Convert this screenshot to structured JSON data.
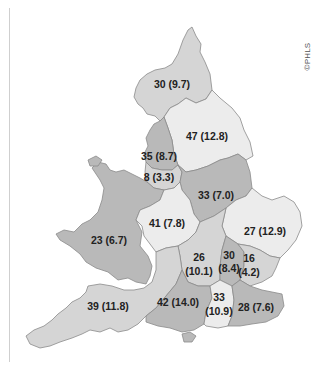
{
  "credit": "©PHLS",
  "colors": {
    "light": "#ececec",
    "medium": "#d5d5d5",
    "dark": "#b9b9b9",
    "border": "#8a8a8a",
    "text": "#222222"
  },
  "regions": [
    {
      "id": "northern",
      "count": 30,
      "rate": "9.7",
      "label": "30 (9.7)",
      "shade": "medium"
    },
    {
      "id": "yorkshire",
      "count": 47,
      "rate": "12.8",
      "label": "47 (12.8)",
      "shade": "light"
    },
    {
      "id": "north-west",
      "count": 35,
      "rate": "8.7",
      "label": "35 (8.7)",
      "shade": "dark"
    },
    {
      "id": "mersey",
      "count": 8,
      "rate": "3.3",
      "label": "8 (3.3)",
      "shade": "medium"
    },
    {
      "id": "trent",
      "count": 33,
      "rate": "7.0",
      "label": "33 (7.0)",
      "shade": "dark"
    },
    {
      "id": "west-midlands",
      "count": 41,
      "rate": "7.8",
      "label": "41 (7.8)",
      "shade": "light"
    },
    {
      "id": "wales",
      "count": 23,
      "rate": "6.7",
      "label": "23 (6.7)",
      "shade": "dark"
    },
    {
      "id": "east-anglia",
      "count": 27,
      "rate": "12.9",
      "label": "27 (12.9)",
      "shade": "light"
    },
    {
      "id": "oxford",
      "count": 26,
      "rate": "10.1",
      "label_line1": "26",
      "label_line2": "(10.1)",
      "shade": "medium"
    },
    {
      "id": "north-west-thames",
      "count": 30,
      "rate": "8.4",
      "label_line1": "30",
      "label_line2": "(8.4)",
      "shade": "dark"
    },
    {
      "id": "north-east-thames",
      "count": 16,
      "rate": "4.2",
      "label_line1": "16",
      "label_line2": "(4.2)",
      "shade": "medium"
    },
    {
      "id": "south-west",
      "count": 39,
      "rate": "11.8",
      "label": "39 (11.8)",
      "shade": "medium"
    },
    {
      "id": "wessex",
      "count": 42,
      "rate": "14.0",
      "label": "42 (14.0)",
      "shade": "dark"
    },
    {
      "id": "south-west-thames",
      "count": 33,
      "rate": "10.9",
      "label_line1": "33",
      "label_line2": "(10.9)",
      "shade": "light"
    },
    {
      "id": "south-east-thames",
      "count": 28,
      "rate": "7.6",
      "label": "28 (7.6)",
      "shade": "dark"
    }
  ]
}
